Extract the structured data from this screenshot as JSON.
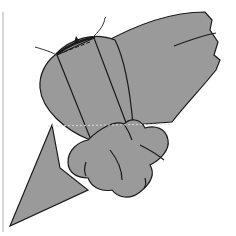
{
  "figure": {
    "type": "line-illustration",
    "colors": {
      "fill": "#9a9a9a",
      "stroke": "#1a1a1a",
      "background": "#ffffff",
      "guide_line": "#d8d8d8",
      "border_line": "#c8c8c8"
    },
    "elements": [
      "left-border-line",
      "main-body-shape",
      "upper-right-wing",
      "diagonal-lower-triangle",
      "vertical-strap",
      "knot-lobes",
      "dashed-guide-line",
      "wire-left",
      "wire-top"
    ]
  }
}
